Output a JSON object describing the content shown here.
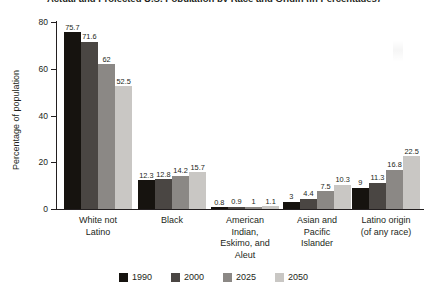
{
  "chart_data": {
    "type": "bar",
    "title": "Actual and Projected U.S. Population by Race and Origin (in Percentages)",
    "xlabel": "",
    "ylabel": "Percentage of population",
    "ylim": [
      0,
      80
    ],
    "yticks": [
      0,
      20,
      40,
      60,
      80
    ],
    "grid": false,
    "legend_position": "bottom",
    "categories": [
      "White not\nLatino",
      "Black",
      "American\nIndian,\nEskimo, and\nAleut",
      "Asian and\nPacific\nIslander",
      "Latino origin\n(of any race)"
    ],
    "category_lines": [
      [
        "White not",
        "Latino"
      ],
      [
        "Black"
      ],
      [
        "American",
        "Indian,",
        "Eskimo, and",
        "Aleut"
      ],
      [
        "Asian and",
        "Pacific",
        "Islander"
      ],
      [
        "Latino origin",
        "(of any race)"
      ]
    ],
    "series": [
      {
        "name": "1990",
        "color": "#16130f",
        "values": [
          75.7,
          12.3,
          0.8,
          3,
          9
        ]
      },
      {
        "name": "2000",
        "color": "#4a4643",
        "values": [
          71.6,
          12.8,
          0.9,
          4.4,
          11.3
        ]
      },
      {
        "name": "2025",
        "color": "#8b8885",
        "values": [
          62,
          14.2,
          1,
          7.5,
          16.8
        ]
      },
      {
        "name": "2050",
        "color": "#c9c7c4",
        "values": [
          52.5,
          15.7,
          1.1,
          10.3,
          22.5
        ]
      }
    ],
    "value_labels": [
      [
        "75.7",
        "71.6",
        "62",
        "52.5"
      ],
      [
        "12.3",
        "12.8",
        "14.2",
        "15.7"
      ],
      [
        "0.8",
        "0.9",
        "1",
        "1.1"
      ],
      [
        "3",
        "4.4",
        "7.5",
        "10.3"
      ],
      [
        "9",
        "11.3",
        "16.8",
        "22.5"
      ]
    ]
  }
}
